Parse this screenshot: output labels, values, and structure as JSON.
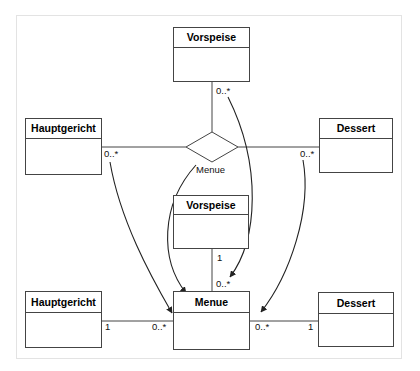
{
  "diagram": {
    "type": "uml-class-diagram",
    "background_color": "#ffffff",
    "frame_color": "#e3e3e3",
    "line_color": "#444444",
    "text_color": "#000000"
  },
  "upper_model": {
    "label": "ternary-association",
    "classes": [
      {
        "id": "vorspeise_top",
        "name": "Vorspeise"
      },
      {
        "id": "hauptgericht_top",
        "name": "Hauptgericht"
      },
      {
        "id": "dessert_top",
        "name": "Dessert"
      }
    ],
    "association": {
      "name": "Menue",
      "multiplicities": {
        "vorspeise": "0..*",
        "hauptgericht": "0..*",
        "dessert": "0..*"
      }
    }
  },
  "lower_model": {
    "label": "reified-association-class",
    "classes": [
      {
        "id": "vorspeise_mid",
        "name": "Vorspeise"
      },
      {
        "id": "menue_bottom",
        "name": "Menue"
      },
      {
        "id": "hauptgericht_bottom",
        "name": "Hauptgericht"
      },
      {
        "id": "dessert_bottom",
        "name": "Dessert"
      }
    ],
    "multiplicities": {
      "vorspeise_end": "1",
      "menue_top_end": "0..*",
      "hauptgericht_end": "1",
      "menue_left_end": "0..*",
      "menue_right_end": "0..*",
      "dessert_end": "1"
    }
  },
  "transform_arrows": [
    {
      "from": "hauptgericht_top",
      "to": "hauptgericht_bottom"
    },
    {
      "from": "vorspeise_top",
      "to": "vorspeise_mid_menue"
    },
    {
      "from": "menue_association",
      "to": "menue_bottom"
    },
    {
      "from": "dessert_top",
      "to": "dessert_bottom"
    }
  ]
}
